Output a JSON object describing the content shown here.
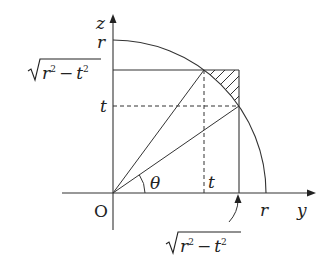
{
  "diagram": {
    "axes": {
      "vertical_label": "z",
      "horizontal_label": "y",
      "origin_label": "O"
    },
    "labels": {
      "r_top": "r",
      "r_right": "r",
      "t_left": "t",
      "t_bottom": "t",
      "theta": "θ",
      "sqrt_left": {
        "radicand_r": "r",
        "exp1": "2",
        "minus": "−",
        "radicand_t": "t",
        "exp2": "2"
      },
      "sqrt_bottom": {
        "radicand_r": "r",
        "exp1": "2",
        "minus": "−",
        "radicand_t": "t",
        "exp2": "2"
      }
    },
    "geometry": {
      "origin_px": [
        113,
        193
      ],
      "radius_px": 153,
      "level_sqrt_px_y": 70,
      "level_t_px_y": 106,
      "x_t_px": 204,
      "x_sqrt_px": 239
    },
    "colors": {
      "stroke": "#333333",
      "text": "#222222",
      "background": "#ffffff"
    }
  }
}
